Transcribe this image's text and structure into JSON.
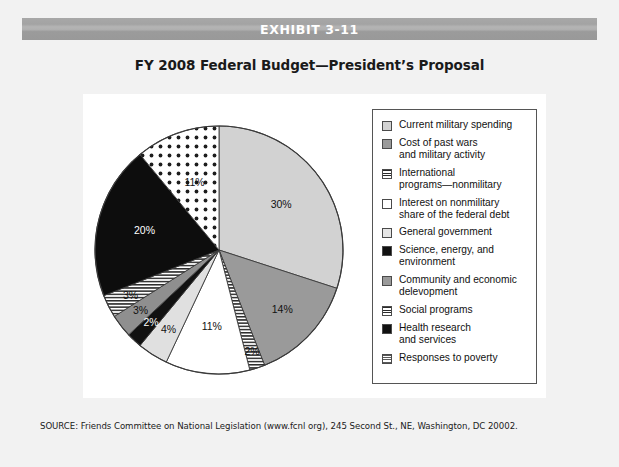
{
  "exhibit": {
    "bar_label": "EXHIBIT 3-11",
    "title": "FY 2008 Federal Budget—President’s Proposal"
  },
  "source": {
    "text": "SOURCE: Friends Committee on National Legislation (www.fcnl org), 245 Second St., NE, Washington, DC 20002."
  },
  "legend": {
    "items": [
      {
        "label": "Current military spending",
        "swatch": "light-gray-solid"
      },
      {
        "label": "Cost of past wars\nand military activity",
        "swatch": "mid-gray-solid"
      },
      {
        "label": "International\nprograms—nonmilitary",
        "swatch": "horizontal-lines"
      },
      {
        "label": "Interest on nonmilitary\nshare of the federal debt",
        "swatch": "white-solid"
      },
      {
        "label": "General government",
        "swatch": "pale-gray-solid"
      },
      {
        "label": "Science, energy, and\nenvironment",
        "swatch": "black-solid"
      },
      {
        "label": "Community and economic\ndelevopment",
        "swatch": "mid-gray-solid"
      },
      {
        "label": "Social programs",
        "swatch": "horizontal-lines"
      },
      {
        "label": "Health research\nand services",
        "swatch": "black-solid"
      },
      {
        "label": "Responses to poverty",
        "swatch": "dotted"
      }
    ]
  },
  "chart_data": {
    "type": "pie",
    "title": "FY 2008 Federal Budget—President’s Proposal",
    "legend_position": "right",
    "total_percent": 100,
    "categories": [
      "Current military spending",
      "Cost of past wars and military activity",
      "International programs—nonmilitary",
      "Interest on nonmilitary share of the federal debt",
      "General government",
      "Science, energy, and environment",
      "Community and economic delevopment",
      "Social programs",
      "Health research and services",
      "Responses to poverty"
    ],
    "values": [
      30,
      14,
      2,
      11,
      4,
      2,
      3,
      3,
      20,
      11
    ],
    "labels": [
      "30%",
      "14%",
      "2%",
      "11%",
      "4%",
      "2%",
      "3%",
      "3%",
      "20%",
      "11%"
    ],
    "slices": [
      {
        "name": "Current military spending",
        "value": 30,
        "label": "30%",
        "fill": "#d2d2d2",
        "pattern": "solid",
        "label_color": "dark"
      },
      {
        "name": "Cost of past wars and military activity",
        "value": 14,
        "label": "14%",
        "fill": "#9a9a9a",
        "pattern": "solid",
        "label_color": "dark"
      },
      {
        "name": "International programs—nonmilitary",
        "value": 2,
        "label": "2%",
        "fill": "#ffffff",
        "pattern": "hlines",
        "label_color": "dark"
      },
      {
        "name": "Interest on nonmilitary share of the federal debt",
        "value": 11,
        "label": "11%",
        "fill": "#ffffff",
        "pattern": "solid",
        "label_color": "dark"
      },
      {
        "name": "General government",
        "value": 4,
        "label": "4%",
        "fill": "#e0e0e0",
        "pattern": "solid",
        "label_color": "dark"
      },
      {
        "name": "Science, energy, and environment",
        "value": 2,
        "label": "2%",
        "fill": "#111111",
        "pattern": "solid",
        "label_color": "light"
      },
      {
        "name": "Community and economic delevopment",
        "value": 3,
        "label": "3%",
        "fill": "#8f8f8f",
        "pattern": "solid",
        "label_color": "dark"
      },
      {
        "name": "Social programs",
        "value": 3,
        "label": "3%",
        "fill": "#ffffff",
        "pattern": "hlines",
        "label_color": "dark"
      },
      {
        "name": "Health research and services",
        "value": 20,
        "label": "20%",
        "fill": "#0d0d0d",
        "pattern": "solid",
        "label_color": "light"
      },
      {
        "name": "Responses to poverty",
        "value": 11,
        "label": "11%",
        "fill": "#ffffff",
        "pattern": "dots",
        "label_color": "dark"
      }
    ]
  },
  "colors": {
    "page_background": "#f2f2f2",
    "panel_background": "#ffffff",
    "bar_gray": "#a3a3a3",
    "outline": "#4a4a4a",
    "text": "#111111"
  }
}
